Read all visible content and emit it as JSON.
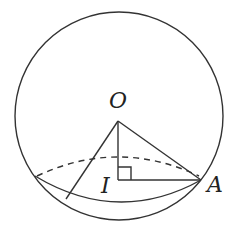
{
  "diagram": {
    "title": "",
    "labels": {
      "O": "O",
      "I": "I",
      "A": "A"
    },
    "colors": {
      "line": "#333333",
      "text": "#222222",
      "background": "#ffffff"
    },
    "sphere": {
      "cx": 119,
      "cy": 116,
      "r": 104
    },
    "section_circle": {
      "cx": 118,
      "cy": 180,
      "rx": 83,
      "ry": 22
    },
    "points": {
      "O": [
        118,
        121
      ],
      "I": [
        118,
        180
      ],
      "A": [
        201,
        180
      ],
      "B": [
        66,
        199
      ]
    },
    "right_angle_marker_size": 13
  }
}
